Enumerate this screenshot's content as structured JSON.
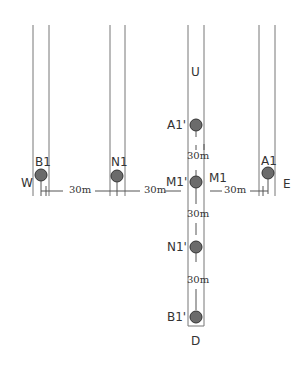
{
  "diagram": {
    "directions": {
      "west": "W",
      "east": "E",
      "up": "U",
      "down": "D"
    },
    "columns": [
      {
        "id": "col-B1",
        "label": "B1"
      },
      {
        "id": "col-N1",
        "label": "N1"
      },
      {
        "id": "col-M1",
        "label": "M1"
      },
      {
        "id": "col-A1",
        "label": "A1"
      }
    ],
    "vertical_points": [
      {
        "label": "A1'"
      },
      {
        "label": "M1'"
      },
      {
        "label": "N1'"
      },
      {
        "label": "B1'"
      }
    ],
    "horizontal_spacing": [
      "30m",
      "30m",
      "30m"
    ],
    "vertical_spacing": [
      "30m",
      "30m",
      "30m"
    ],
    "colors": {
      "line": "#777777",
      "point_fill": "#6b6b6b",
      "point_stroke": "#333333",
      "text": "#333333"
    }
  }
}
